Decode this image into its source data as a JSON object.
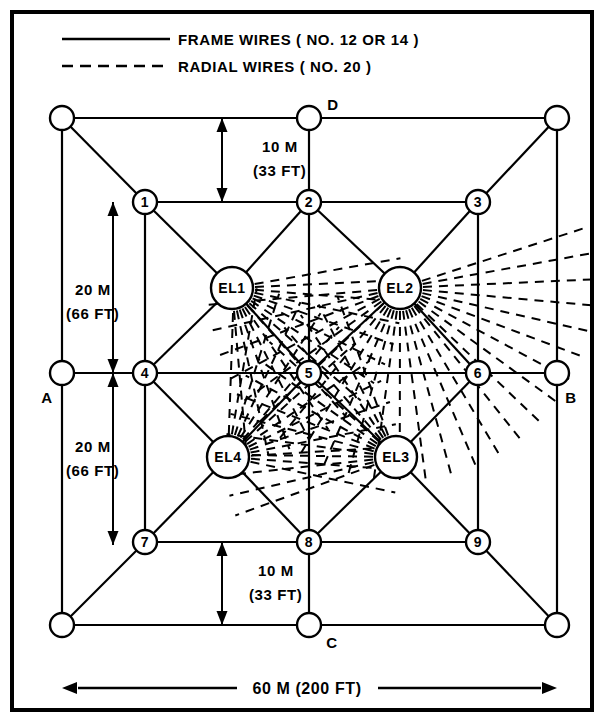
{
  "figure": {
    "border_color": "#000000",
    "background": "#ffffff",
    "line_color": "#000000"
  },
  "legend": {
    "items": [
      {
        "style": "solid",
        "label": "FRAME WIRES ( NO. 12 OR 14 )",
        "sample_name": "solid-line-sample"
      },
      {
        "style": "dashed",
        "label": "RADIAL WIRES ( NO. 20 )",
        "sample_name": "dashed-line-sample"
      }
    ]
  },
  "dimensions": [
    {
      "id": "top-gap",
      "value": "10 M",
      "secondary": "(33 FT)",
      "orientation": "vertical"
    },
    {
      "id": "upper-span",
      "value": "20 M",
      "secondary": "(66 FT)",
      "orientation": "vertical"
    },
    {
      "id": "lower-span",
      "value": "20 M",
      "secondary": "(66 FT)",
      "orientation": "vertical"
    },
    {
      "id": "bottom-gap",
      "value": "10 M",
      "secondary": "(33 FT)",
      "orientation": "vertical"
    },
    {
      "id": "overall-width",
      "value": "60 M (200 FT)",
      "secondary": "",
      "orientation": "horizontal"
    }
  ],
  "corner_labels": [
    {
      "id": "A",
      "label": "A"
    },
    {
      "id": "B",
      "label": "B"
    },
    {
      "id": "C",
      "label": "C"
    },
    {
      "id": "D",
      "label": "D"
    }
  ],
  "nodes": {
    "corners": [
      {
        "id": "corner-nw",
        "label": "",
        "x": 62,
        "y": 118,
        "r": 12
      },
      {
        "id": "corner-ne",
        "label": "",
        "x": 557,
        "y": 118,
        "r": 12
      },
      {
        "id": "corner-sw",
        "label": "",
        "x": 62,
        "y": 625,
        "r": 12
      },
      {
        "id": "corner-se",
        "label": "",
        "x": 557,
        "y": 625,
        "r": 12
      },
      {
        "id": "anchor-a",
        "label": "",
        "x": 62,
        "y": 373,
        "r": 12
      },
      {
        "id": "anchor-b",
        "label": "",
        "x": 557,
        "y": 373,
        "r": 12
      },
      {
        "id": "anchor-c",
        "label": "",
        "x": 309,
        "y": 625,
        "r": 12
      },
      {
        "id": "anchor-d",
        "label": "",
        "x": 309,
        "y": 118,
        "r": 12
      }
    ],
    "numbered": [
      {
        "id": "node-1",
        "label": "1",
        "x": 145,
        "y": 202,
        "r": 12
      },
      {
        "id": "node-2",
        "label": "2",
        "x": 309,
        "y": 202,
        "r": 12
      },
      {
        "id": "node-3",
        "label": "3",
        "x": 478,
        "y": 202,
        "r": 12
      },
      {
        "id": "node-4",
        "label": "4",
        "x": 145,
        "y": 373,
        "r": 12
      },
      {
        "id": "node-5",
        "label": "5",
        "x": 309,
        "y": 373,
        "r": 12
      },
      {
        "id": "node-6",
        "label": "6",
        "x": 478,
        "y": 373,
        "r": 12
      },
      {
        "id": "node-7",
        "label": "7",
        "x": 145,
        "y": 542,
        "r": 12
      },
      {
        "id": "node-8",
        "label": "8",
        "x": 309,
        "y": 542,
        "r": 12
      },
      {
        "id": "node-9",
        "label": "9",
        "x": 478,
        "y": 542,
        "r": 12
      }
    ],
    "elements": [
      {
        "id": "node-el1",
        "label": "EL1",
        "x": 232,
        "y": 288,
        "r": 21
      },
      {
        "id": "node-el2",
        "label": "EL2",
        "x": 400,
        "y": 288,
        "r": 21
      },
      {
        "id": "node-el3",
        "label": "EL3",
        "x": 396,
        "y": 457,
        "r": 21
      },
      {
        "id": "node-el4",
        "label": "EL4",
        "x": 228,
        "y": 457,
        "r": 21
      }
    ]
  },
  "radial_fans": [
    {
      "from": "node-el1",
      "spread_start_deg": -10,
      "spread_end_deg": 85,
      "count": 14,
      "length": 150
    },
    {
      "from": "node-el2",
      "spread_start_deg": -18,
      "spread_end_deg": 175,
      "count": 26,
      "length": 175
    },
    {
      "from": "node-el3",
      "spread_start_deg": 160,
      "spread_end_deg": 250,
      "count": 14,
      "length": 150
    },
    {
      "from": "node-el4",
      "spread_start_deg": -88,
      "spread_end_deg": 12,
      "count": 14,
      "length": 150
    }
  ]
}
